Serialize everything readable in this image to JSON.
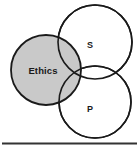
{
  "figure": {
    "name": "venn-diagram",
    "type": "three-circle-venn",
    "background_color": "#ffffff",
    "stroke_color": "#1a1a1a",
    "rule_color": "#333333"
  },
  "circles": [
    {
      "id": "ethics",
      "label": "Ethics",
      "fill": "#c9c9c9",
      "stroke": "#1a1a1a",
      "cx": 46,
      "cy": 70,
      "r": 35,
      "label_x": 43,
      "label_y": 70
    },
    {
      "id": "s",
      "label": "S",
      "fill": "#ffffff",
      "stroke": "#1a1a1a",
      "cx": 95,
      "cy": 42,
      "r": 37,
      "label_x": 90,
      "label_y": 46
    },
    {
      "id": "p",
      "label": "P",
      "fill": "#ffffff",
      "stroke": "#1a1a1a",
      "cx": 95,
      "cy": 102,
      "r": 36,
      "label_x": 90,
      "label_y": 110
    }
  ],
  "divider": {
    "name": "horizontal-rule",
    "y": 143,
    "x1": 2,
    "x2": 137,
    "thickness": 2.2,
    "color": "#333333"
  }
}
